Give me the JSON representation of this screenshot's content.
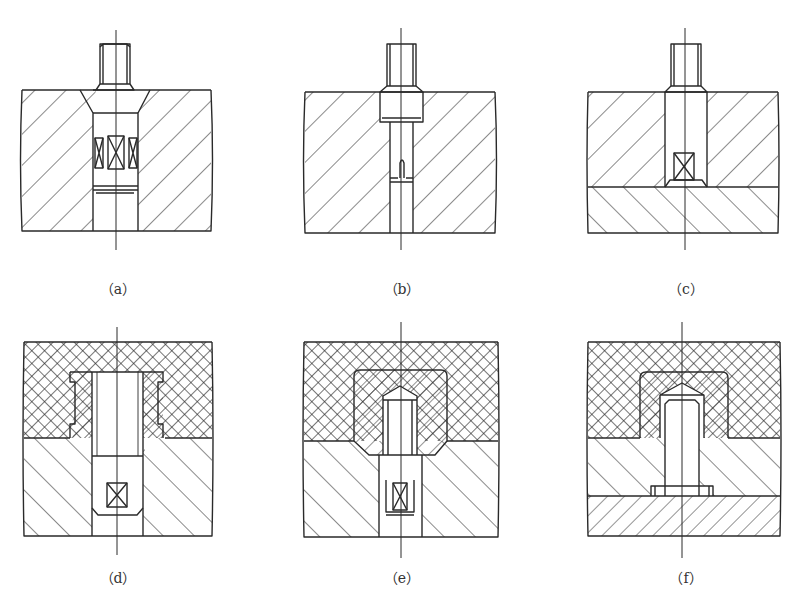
{
  "figure": {
    "top_cut_text": "",
    "panels": [
      {
        "id": "a",
        "caption": "（a）",
        "description": "Stud/pin in a single hatched block, countersunk hole with knurled sleeve section"
      },
      {
        "id": "b",
        "caption": "（b）",
        "description": "Stepped pin in a single hatched block with split tail"
      },
      {
        "id": "c",
        "caption": "（c）",
        "description": "Pin in upper block seated on lower hatched plate"
      },
      {
        "id": "d",
        "caption": "（d）",
        "description": "Insert in cross-hatched (non-metal) upper layer above hatched metal block"
      },
      {
        "id": "e",
        "caption": "（e）",
        "description": "Insert with pointed end in cross-hatched layer, split tail in metal block"
      },
      {
        "id": "f",
        "caption": "（f）",
        "description": "Headed pin through metal block into cross-hatched layer, on lower plate"
      }
    ]
  },
  "colors": {
    "line": "#2a2a2a",
    "background": "#ffffff"
  }
}
